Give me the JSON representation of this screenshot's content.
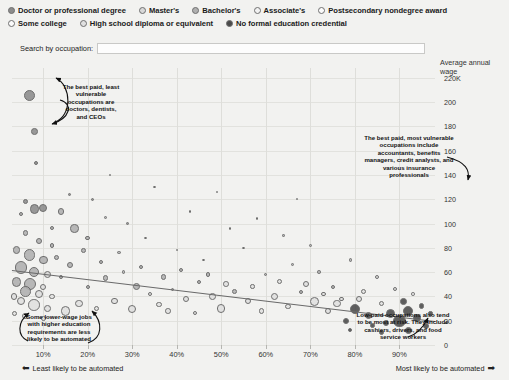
{
  "legend": {
    "rows": [
      [
        {
          "label": "Doctor or professional degree",
          "shade": "#8c8c8c"
        },
        {
          "label": "Master's",
          "shade": "#d8d8d8"
        },
        {
          "label": "Bachelor's",
          "shade": "#b0b0b0"
        },
        {
          "label": "Associate's",
          "shade": "#f2f2f2"
        },
        {
          "label": "Postsecondary nondegree award",
          "shade": "#fbfbfb"
        }
      ],
      [
        {
          "label": "Some college",
          "shade": "#fbfbfb"
        },
        {
          "label": "High school diploma or equivalent",
          "shade": "#e0e0e0"
        },
        {
          "label": "No formal education credential",
          "shade": "#4a4a4a"
        }
      ]
    ]
  },
  "search": {
    "label": "Search by occupation:",
    "value": "",
    "placeholder": ""
  },
  "chart_data": {
    "type": "scatter",
    "title": "",
    "xlabel": "",
    "ylabel": "Average annual wage",
    "x_axis_note_left": "Least likely to be automated",
    "x_axis_note_right": "Most likely to be automated",
    "xticks": [
      "10%",
      "20%",
      "30%",
      "40%",
      "50%",
      "60%",
      "70%",
      "80%",
      "90%"
    ],
    "xtick_values": [
      10,
      20,
      30,
      40,
      50,
      60,
      70,
      80,
      90
    ],
    "yticks": [
      "0",
      "20",
      "40",
      "60",
      "80",
      "100",
      "120",
      "140",
      "160",
      "180",
      "200",
      "220K"
    ],
    "ytick_values": [
      0,
      20,
      40,
      60,
      80,
      100,
      120,
      140,
      160,
      180,
      200,
      220
    ],
    "xlim": [
      3,
      98
    ],
    "ylim": [
      0,
      228
    ],
    "grid": true,
    "legend_position": "top",
    "size_encoding": "number of workers employed",
    "color_encoding": "typical entry-level education",
    "trendline": {
      "x0": 3,
      "y0": 62,
      "x1": 98,
      "y1": 20
    },
    "points": [
      {
        "x": 7,
        "y": 205,
        "r": 5.5,
        "shade": "#8c8c8c"
      },
      {
        "x": 8,
        "y": 176,
        "r": 3.4,
        "shade": "#8c8c8c"
      },
      {
        "x": 8.5,
        "y": 150,
        "r": 2.0,
        "shade": "#8c8c8c"
      },
      {
        "x": 6,
        "y": 118,
        "r": 2.6,
        "shade": "#8c8c8c"
      },
      {
        "x": 8,
        "y": 112,
        "r": 4.6,
        "shade": "#8c8c8c"
      },
      {
        "x": 10,
        "y": 113,
        "r": 4.0,
        "shade": "#8c8c8c"
      },
      {
        "x": 5,
        "y": 108,
        "r": 2.0,
        "shade": "#b0b0b0"
      },
      {
        "x": 14,
        "y": 110,
        "r": 3.4,
        "shade": "#b0b0b0"
      },
      {
        "x": 21,
        "y": 120,
        "r": 1.6,
        "shade": "#8c8c8c"
      },
      {
        "x": 24,
        "y": 105,
        "r": 1.4,
        "shade": "#b0b0b0"
      },
      {
        "x": 17,
        "y": 96,
        "r": 4.2,
        "shade": "#b0b0b0"
      },
      {
        "x": 20,
        "y": 88,
        "r": 2.2,
        "shade": "#b0b0b0"
      },
      {
        "x": 6,
        "y": 92,
        "r": 2.8,
        "shade": "#b0b0b0"
      },
      {
        "x": 9,
        "y": 86,
        "r": 3.0,
        "shade": "#b0b0b0"
      },
      {
        "x": 12,
        "y": 82,
        "r": 2.2,
        "shade": "#b0b0b0"
      },
      {
        "x": 4,
        "y": 78,
        "r": 3.8,
        "shade": "#b0b0b0"
      },
      {
        "x": 7,
        "y": 74,
        "r": 5.6,
        "shade": "#b0b0b0"
      },
      {
        "x": 10,
        "y": 70,
        "r": 4.4,
        "shade": "#b0b0b0"
      },
      {
        "x": 13,
        "y": 72,
        "r": 2.6,
        "shade": "#b0b0b0"
      },
      {
        "x": 16,
        "y": 66,
        "r": 3.2,
        "shade": "#b0b0b0"
      },
      {
        "x": 5,
        "y": 64,
        "r": 6.4,
        "shade": "#b0b0b0"
      },
      {
        "x": 8,
        "y": 60,
        "r": 5.0,
        "shade": "#b0b0b0"
      },
      {
        "x": 11,
        "y": 58,
        "r": 3.6,
        "shade": "#d8d8d8"
      },
      {
        "x": 14,
        "y": 56,
        "r": 2.4,
        "shade": "#b0b0b0"
      },
      {
        "x": 4,
        "y": 52,
        "r": 4.8,
        "shade": "#b0b0b0"
      },
      {
        "x": 7,
        "y": 50,
        "r": 6.0,
        "shade": "#b0b0b0"
      },
      {
        "x": 10,
        "y": 48,
        "r": 3.0,
        "shade": "#e0e0e0"
      },
      {
        "x": 6,
        "y": 44,
        "r": 5.4,
        "shade": "#b0b0b0"
      },
      {
        "x": 9,
        "y": 42,
        "r": 4.0,
        "shade": "#e0e0e0"
      },
      {
        "x": 12,
        "y": 40,
        "r": 2.8,
        "shade": "#e0e0e0"
      },
      {
        "x": 5,
        "y": 36,
        "r": 4.2,
        "shade": "#e0e0e0"
      },
      {
        "x": 8,
        "y": 33,
        "r": 5.8,
        "shade": "#e0e0e0"
      },
      {
        "x": 11,
        "y": 30,
        "r": 3.4,
        "shade": "#e0e0e0"
      },
      {
        "x": 15,
        "y": 28,
        "r": 4.6,
        "shade": "#e0e0e0"
      },
      {
        "x": 6,
        "y": 24,
        "r": 3.0,
        "shade": "#d8d8d8"
      },
      {
        "x": 10,
        "y": 22,
        "r": 2.4,
        "shade": "#e0e0e0"
      },
      {
        "x": 18,
        "y": 34,
        "r": 3.8,
        "shade": "#e0e0e0"
      },
      {
        "x": 22,
        "y": 30,
        "r": 2.6,
        "shade": "#e0e0e0"
      },
      {
        "x": 26,
        "y": 36,
        "r": 3.2,
        "shade": "#e0e0e0"
      },
      {
        "x": 20,
        "y": 48,
        "r": 2.0,
        "shade": "#b0b0b0"
      },
      {
        "x": 24,
        "y": 55,
        "r": 2.8,
        "shade": "#b0b0b0"
      },
      {
        "x": 28,
        "y": 60,
        "r": 1.8,
        "shade": "#b0b0b0"
      },
      {
        "x": 31,
        "y": 48,
        "r": 3.6,
        "shade": "#b0b0b0"
      },
      {
        "x": 34,
        "y": 42,
        "r": 2.2,
        "shade": "#e0e0e0"
      },
      {
        "x": 30,
        "y": 30,
        "r": 4.0,
        "shade": "#e0e0e0"
      },
      {
        "x": 36,
        "y": 33,
        "r": 2.6,
        "shade": "#e0e0e0"
      },
      {
        "x": 39,
        "y": 46,
        "r": 1.6,
        "shade": "#b0b0b0"
      },
      {
        "x": 42,
        "y": 38,
        "r": 3.0,
        "shade": "#e0e0e0"
      },
      {
        "x": 45,
        "y": 52,
        "r": 2.2,
        "shade": "#b0b0b0"
      },
      {
        "x": 48,
        "y": 40,
        "r": 3.4,
        "shade": "#e0e0e0"
      },
      {
        "x": 38,
        "y": 28,
        "r": 2.8,
        "shade": "#e0e0e0"
      },
      {
        "x": 44,
        "y": 26,
        "r": 2.0,
        "shade": "#e0e0e0"
      },
      {
        "x": 50,
        "y": 30,
        "r": 4.2,
        "shade": "#e0e0e0"
      },
      {
        "x": 53,
        "y": 44,
        "r": 2.4,
        "shade": "#b0b0b0"
      },
      {
        "x": 56,
        "y": 36,
        "r": 3.2,
        "shade": "#e0e0e0"
      },
      {
        "x": 59,
        "y": 28,
        "r": 2.8,
        "shade": "#e0e0e0"
      },
      {
        "x": 62,
        "y": 40,
        "r": 3.8,
        "shade": "#e0e0e0"
      },
      {
        "x": 65,
        "y": 32,
        "r": 2.6,
        "shade": "#e0e0e0"
      },
      {
        "x": 68,
        "y": 44,
        "r": 2.0,
        "shade": "#b0b0b0"
      },
      {
        "x": 71,
        "y": 36,
        "r": 4.4,
        "shade": "#e0e0e0"
      },
      {
        "x": 74,
        "y": 28,
        "r": 3.0,
        "shade": "#e0e0e0"
      },
      {
        "x": 77,
        "y": 38,
        "r": 2.2,
        "shade": "#e0e0e0"
      },
      {
        "x": 80,
        "y": 30,
        "r": 5.0,
        "shade": "#4a4a4a"
      },
      {
        "x": 83,
        "y": 24,
        "r": 3.6,
        "shade": "#4a4a4a"
      },
      {
        "x": 86,
        "y": 34,
        "r": 2.8,
        "shade": "#e0e0e0"
      },
      {
        "x": 88,
        "y": 26,
        "r": 4.8,
        "shade": "#4a4a4a"
      },
      {
        "x": 90,
        "y": 20,
        "r": 6.2,
        "shade": "#4a4a4a"
      },
      {
        "x": 92,
        "y": 28,
        "r": 5.2,
        "shade": "#4a4a4a"
      },
      {
        "x": 94,
        "y": 22,
        "r": 4.0,
        "shade": "#4a4a4a"
      },
      {
        "x": 91,
        "y": 36,
        "r": 3.4,
        "shade": "#4a4a4a"
      },
      {
        "x": 87,
        "y": 18,
        "r": 3.0,
        "shade": "#4a4a4a"
      },
      {
        "x": 84,
        "y": 16,
        "r": 2.4,
        "shade": "#4a4a4a"
      },
      {
        "x": 95,
        "y": 32,
        "r": 2.8,
        "shade": "#4a4a4a"
      },
      {
        "x": 78,
        "y": 20,
        "r": 3.2,
        "shade": "#4a4a4a"
      },
      {
        "x": 75,
        "y": 48,
        "r": 2.0,
        "shade": "#b0b0b0"
      },
      {
        "x": 82,
        "y": 44,
        "r": 2.6,
        "shade": "#e0e0e0"
      },
      {
        "x": 89,
        "y": 46,
        "r": 2.2,
        "shade": "#e0e0e0"
      },
      {
        "x": 93,
        "y": 42,
        "r": 1.8,
        "shade": "#e0e0e0"
      },
      {
        "x": 60,
        "y": 58,
        "r": 1.6,
        "shade": "#b0b0b0"
      },
      {
        "x": 66,
        "y": 66,
        "r": 1.4,
        "shade": "#b0b0b0"
      },
      {
        "x": 72,
        "y": 60,
        "r": 1.8,
        "shade": "#b0b0b0"
      },
      {
        "x": 46,
        "y": 70,
        "r": 1.4,
        "shade": "#b0b0b0"
      },
      {
        "x": 40,
        "y": 78,
        "r": 1.2,
        "shade": "#b0b0b0"
      },
      {
        "x": 33,
        "y": 88,
        "r": 1.4,
        "shade": "#8c8c8c"
      },
      {
        "x": 55,
        "y": 80,
        "r": 1.3,
        "shade": "#b0b0b0"
      },
      {
        "x": 64,
        "y": 90,
        "r": 1.2,
        "shade": "#b0b0b0"
      },
      {
        "x": 70,
        "y": 82,
        "r": 1.4,
        "shade": "#b0b0b0"
      },
      {
        "x": 79,
        "y": 70,
        "r": 1.6,
        "shade": "#b0b0b0"
      },
      {
        "x": 85,
        "y": 56,
        "r": 2.0,
        "shade": "#e0e0e0"
      },
      {
        "x": 29,
        "y": 100,
        "r": 1.4,
        "shade": "#8c8c8c"
      },
      {
        "x": 43,
        "y": 110,
        "r": 1.2,
        "shade": "#8c8c8c"
      },
      {
        "x": 52,
        "y": 96,
        "r": 1.2,
        "shade": "#b0b0b0"
      },
      {
        "x": 58,
        "y": 104,
        "r": 1.2,
        "shade": "#b0b0b0"
      },
      {
        "x": 49,
        "y": 126,
        "r": 1.3,
        "shade": "#8c8c8c"
      },
      {
        "x": 67,
        "y": 120,
        "r": 1.2,
        "shade": "#8c8c8c"
      },
      {
        "x": 35,
        "y": 130,
        "r": 1.3,
        "shade": "#8c8c8c"
      },
      {
        "x": 25,
        "y": 140,
        "r": 1.2,
        "shade": "#8c8c8c"
      },
      {
        "x": 16,
        "y": 124,
        "r": 1.4,
        "shade": "#8c8c8c"
      },
      {
        "x": 12,
        "y": 96,
        "r": 2.0,
        "shade": "#b0b0b0"
      },
      {
        "x": 19,
        "y": 78,
        "r": 2.4,
        "shade": "#b0b0b0"
      },
      {
        "x": 23,
        "y": 68,
        "r": 2.0,
        "shade": "#b0b0b0"
      },
      {
        "x": 27,
        "y": 76,
        "r": 1.8,
        "shade": "#b0b0b0"
      },
      {
        "x": 32,
        "y": 64,
        "r": 2.2,
        "shade": "#b0b0b0"
      },
      {
        "x": 37,
        "y": 56,
        "r": 2.6,
        "shade": "#b0b0b0"
      },
      {
        "x": 41,
        "y": 62,
        "r": 2.0,
        "shade": "#b0b0b0"
      },
      {
        "x": 47,
        "y": 58,
        "r": 2.4,
        "shade": "#b0b0b0"
      },
      {
        "x": 51,
        "y": 50,
        "r": 2.8,
        "shade": "#e0e0e0"
      },
      {
        "x": 57,
        "y": 48,
        "r": 2.2,
        "shade": "#e0e0e0"
      },
      {
        "x": 63,
        "y": 52,
        "r": 2.6,
        "shade": "#e0e0e0"
      },
      {
        "x": 69,
        "y": 50,
        "r": 3.0,
        "shade": "#e0e0e0"
      },
      {
        "x": 73,
        "y": 42,
        "r": 2.4,
        "shade": "#e0e0e0"
      },
      {
        "x": 76,
        "y": 34,
        "r": 3.6,
        "shade": "#e0e0e0"
      },
      {
        "x": 81,
        "y": 38,
        "r": 3.0,
        "shade": "#e0e0e0"
      },
      {
        "x": 3.5,
        "y": 40,
        "r": 3.2,
        "shade": "#e0e0e0"
      },
      {
        "x": 3.5,
        "y": 26,
        "r": 2.6,
        "shade": "#e0e0e0"
      },
      {
        "x": 96,
        "y": 16,
        "r": 3.0,
        "shade": "#4a4a4a"
      },
      {
        "x": 97,
        "y": 26,
        "r": 2.2,
        "shade": "#4a4a4a"
      },
      {
        "x": 86,
        "y": 10,
        "r": 2.6,
        "shade": "#4a4a4a"
      },
      {
        "x": 92,
        "y": 12,
        "r": 3.4,
        "shade": "#4a4a4a"
      },
      {
        "x": 79,
        "y": 12,
        "r": 2.0,
        "shade": "#4a4a4a"
      }
    ]
  },
  "annotations": [
    {
      "name": "annotation-best-paid-least-vulnerable",
      "text": "The best paid, least vulnerable occupations are doctors, dentists, and CEOs"
    },
    {
      "name": "annotation-best-paid-most-vulnerable",
      "text": "The best paid, most vulnerable occupations include accountants, benefits managers, credit analysts, and various insurance professionals"
    },
    {
      "name": "annotation-lower-wage-higher-education",
      "text": "Some lower-wage jobs with higher education requirements are less likely to be automated"
    },
    {
      "name": "annotation-low-paid-at-risk",
      "text": "Low-paid occupations also tend to be most at risk. They include cashiers, drivers, and food service workers"
    }
  ]
}
